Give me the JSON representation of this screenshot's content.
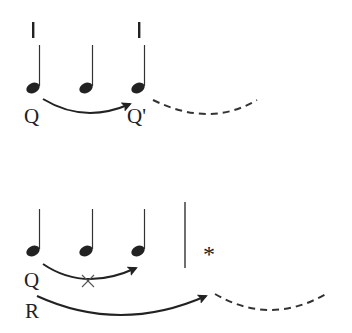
{
  "diagram": {
    "type": "music-notation-relations",
    "top_system": {
      "notes": [
        {
          "x": 32,
          "y": 88,
          "stem_top": 45
        },
        {
          "x": 86,
          "y": 88,
          "stem_top": 45
        },
        {
          "x": 138,
          "y": 88,
          "stem_top": 45
        }
      ],
      "beat_marks": [
        {
          "x": 33
        },
        {
          "x": 139
        }
      ],
      "labels": {
        "source": "Q",
        "target": "Q'"
      },
      "arrow": {
        "from": "Q",
        "to": "Q'",
        "style": "solid"
      },
      "continuation": {
        "style": "dashed"
      }
    },
    "bottom_system": {
      "notes": [
        {
          "x": 32,
          "y": 251,
          "stem_top": 209
        },
        {
          "x": 86,
          "y": 251,
          "stem_top": 209
        },
        {
          "x": 138,
          "y": 251,
          "stem_top": 209
        }
      ],
      "barline": {
        "x": 185
      },
      "asterisk": "*",
      "cross_mark": "×",
      "labels": {
        "q": "Q",
        "r": "R"
      },
      "arrow_q": {
        "from": "Q",
        "to": "third note",
        "style": "solid",
        "blocked": true
      },
      "arrow_r": {
        "from": "R",
        "to": "beyond barline",
        "style": "solid"
      },
      "continuation": {
        "style": "dashed"
      }
    }
  },
  "colors": {
    "ink": "#222222",
    "background": "#ffffff"
  }
}
